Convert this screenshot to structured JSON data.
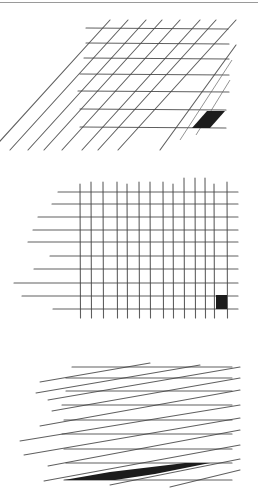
{
  "figure": {
    "panels": [
      {
        "id": "sheared-grid",
        "description": "grid sheared diagonally with one shaded cell",
        "horizontal_lines_y": [
          28,
          43,
          58,
          74,
          91,
          109,
          127
        ],
        "horizontal_x_range": [
          80,
          230
        ],
        "diagonal_count": 11,
        "highlight_cell": "bottom-right"
      },
      {
        "id": "square-grid",
        "description": "rectilinear grid with one shaded cell",
        "horizontal_lines_y": [
          192,
          204,
          217,
          230,
          242,
          256,
          269,
          283,
          296,
          309
        ],
        "vertical_lines_x": [
          80,
          91,
          103,
          117,
          127,
          139,
          150,
          163,
          173,
          184,
          195,
          205,
          214,
          227
        ],
        "highlight_cell": "bottom-right"
      },
      {
        "id": "strongly-sheared-grid",
        "description": "grid with strong shear, shaded cell stretched into a thin sliver",
        "horizontal_lines_y": [
          367,
          378,
          391,
          405,
          420,
          434,
          449,
          463,
          480
        ],
        "horizontal_x_range": [
          65,
          232
        ],
        "highlight_cell": "bottom-left sliver"
      }
    ],
    "colors": {
      "line": "#444444",
      "shade": "#1c1c1c",
      "rule": "#9a9a9a"
    }
  }
}
